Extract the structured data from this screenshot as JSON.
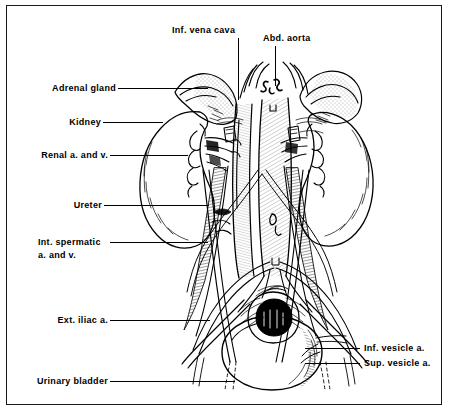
{
  "figure": {
    "style": "black-and-white line drawing",
    "ink_color": "#000000",
    "background_color": "#ffffff",
    "border_color": "#1a1a1a"
  },
  "labels": [
    {
      "id": "inf-vena-cava",
      "text": "Inf. vena cava",
      "lines": [
        "Inf. vena cava"
      ]
    },
    {
      "id": "abd-aorta",
      "text": "Abd. aorta",
      "lines": [
        "Abd. aorta"
      ]
    },
    {
      "id": "adrenal-gland",
      "text": "Adrenal gland",
      "lines": [
        "Adrenal gland"
      ]
    },
    {
      "id": "kidney",
      "text": "Kidney",
      "lines": [
        "Kidney"
      ]
    },
    {
      "id": "renal-a-and-v",
      "text": "Renal a. and v.",
      "lines": [
        "Renal a. and v."
      ]
    },
    {
      "id": "ureter",
      "text": "Ureter",
      "lines": [
        "Ureter"
      ]
    },
    {
      "id": "int-spermatic",
      "text": "Int. spermatic a. and v.",
      "lines": [
        "Int. spermatic",
        "a. and v."
      ]
    },
    {
      "id": "ext-iliac-a",
      "text": "Ext. iliac a.",
      "lines": [
        "Ext. iliac a."
      ]
    },
    {
      "id": "urinary-bladder",
      "text": "Urinary bladder",
      "lines": [
        "Urinary bladder"
      ]
    },
    {
      "id": "inf-vesicle-a",
      "text": "Inf. vesicle a.",
      "lines": [
        "Inf. vesicle a."
      ]
    },
    {
      "id": "sup-vesicle-a",
      "text": "Sup. vesicle a.",
      "lines": [
        "Sup. vesicle a."
      ]
    }
  ],
  "label_text": {
    "inf_vena_cava": "Inf. vena cava",
    "abd_aorta": "Abd. aorta",
    "adrenal_gland": "Adrenal gland",
    "kidney": "Kidney",
    "renal_a_and_v": "Renal a. and v.",
    "ureter": "Ureter",
    "int_spermatic_line1": "Int. spermatic",
    "int_spermatic_line2": "a. and v.",
    "ext_iliac_a": "Ext. iliac a.",
    "urinary_bladder": "Urinary bladder",
    "inf_vesicle_a": "Inf. vesicle a.",
    "sup_vesicle_a": "Sup. vesicle a."
  },
  "structures": [
    "left adrenal gland",
    "right adrenal gland",
    "left kidney",
    "right kidney",
    "inferior vena cava",
    "abdominal aorta",
    "renal artery and vein",
    "ureter",
    "internal spermatic artery and vein",
    "external iliac artery",
    "urinary bladder",
    "inferior vesicle artery",
    "superior vesicle artery"
  ]
}
